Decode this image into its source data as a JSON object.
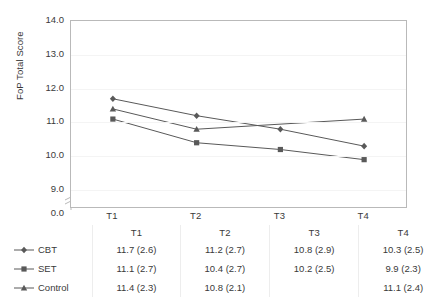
{
  "chart_data": {
    "type": "line",
    "title": "",
    "xlabel": "",
    "ylabel": "FoP Total Score",
    "categories": [
      "T1",
      "T2",
      "T3",
      "T4"
    ],
    "ylim": [
      8.5,
      14.0
    ],
    "yticks": [
      "0.0",
      "9.0",
      "10.0",
      "11.0",
      "12.0",
      "13.0",
      "14.0"
    ],
    "ytick_values": [
      0.0,
      9.0,
      10.0,
      11.0,
      12.0,
      13.0,
      14.0
    ],
    "axis_break": true,
    "grid": true,
    "legend_position": "table-left",
    "series": [
      {
        "name": "CBT",
        "marker": "diamond",
        "values": [
          11.7,
          11.2,
          10.8,
          10.3
        ],
        "sd": [
          2.6,
          2.7,
          2.9,
          2.5
        ],
        "labels": [
          "11.7 (2.6)",
          "11.2 (2.7)",
          "10.8 (2.9)",
          "10.3 (2.5)"
        ]
      },
      {
        "name": "SET",
        "marker": "square",
        "values": [
          11.1,
          10.4,
          10.2,
          9.9
        ],
        "sd": [
          2.7,
          2.7,
          2.5,
          2.3
        ],
        "labels": [
          "11.1 (2.7)",
          "10.4 (2.7)",
          "10.2 (2.5)",
          "9.9 (2.3)"
        ]
      },
      {
        "name": "Control",
        "marker": "triangle",
        "values": [
          11.4,
          10.8,
          null,
          11.1
        ],
        "sd": [
          2.3,
          2.1,
          null,
          2.4
        ],
        "labels": [
          "11.4 (2.3)",
          "10.8 (2.1)",
          "",
          "11.1 (2.4)"
        ]
      }
    ],
    "colors": {
      "series_line": "#595959",
      "axis": "#b9b9b9",
      "grid": "#f4f4f4",
      "text": "#3a3a3a"
    }
  },
  "table": {
    "corner": "",
    "headers": [
      "T1",
      "T2",
      "T3",
      "T4"
    ],
    "rows": [
      {
        "series": "CBT",
        "cells": [
          "11.7 (2.6)",
          "11.2 (2.7)",
          "10.8 (2.9)",
          "10.3 (2.5)"
        ]
      },
      {
        "series": "SET",
        "cells": [
          "11.1 (2.7)",
          "10.4 (2.7)",
          "10.2 (2.5)",
          "9.9 (2.3)"
        ]
      },
      {
        "series": "Control",
        "cells": [
          "11.4 (2.3)",
          "10.8 (2.1)",
          "",
          "11.1 (2.4)"
        ]
      }
    ]
  }
}
